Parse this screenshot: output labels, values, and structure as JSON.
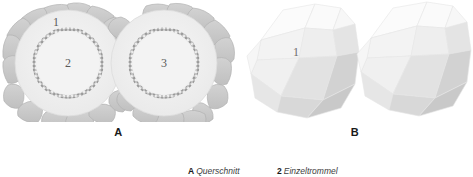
{
  "figure": {
    "background": "#ffffff",
    "panels": [
      {
        "id": "a",
        "letter": "A",
        "type": "cross-section",
        "annotations": [
          {
            "id": "1",
            "label": "1",
            "x": 56,
            "y": 26
          },
          {
            "id": "2",
            "label": "2",
            "x": 68,
            "y": 63
          },
          {
            "id": "3",
            "label": "3",
            "x": 164,
            "y": 63
          }
        ],
        "colors": {
          "outer_cell_fill": "#c7c7c7",
          "outer_cell_stroke": "#b0b0b0",
          "inner_disc_fill": "#efefef",
          "inner_disc_stroke": "#dcdcdc",
          "serrated_ring_stroke": "#9a9a9a",
          "number": "#5a5a5a"
        }
      },
      {
        "id": "b",
        "letter": "B",
        "type": "polyhedron-pair",
        "annotations": [
          {
            "id": "1",
            "label": "1",
            "x": 59,
            "y": 52
          }
        ],
        "colors": {
          "facet_light": "#f2f2f2",
          "facet_mid": "#e0e0e0",
          "facet_dark": "#cfcfcf",
          "facet_darker": "#c2c2c2",
          "facet_stroke": "#e8e8e8",
          "number": "#6b6b6b"
        }
      }
    ],
    "caption": {
      "items": [
        {
          "key": "A",
          "text": "Querschnitt"
        },
        {
          "key": "2",
          "text": "Einzeltrommel"
        }
      ]
    }
  }
}
